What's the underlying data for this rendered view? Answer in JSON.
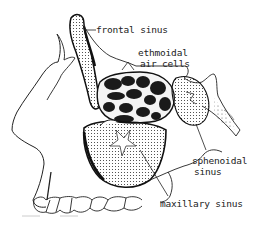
{
  "diagram": {
    "type": "anatomical-illustration",
    "labels": {
      "frontal": "frontal sinus",
      "ethmoidal_line1": "ethmoidal",
      "ethmoidal_line2": "air cells",
      "sphenoidal_line1": "sphenoidal",
      "sphenoidal_line2": "sinus",
      "maxillary": "maxillary sinus"
    },
    "colors": {
      "ink": "#222222",
      "background": "#ffffff",
      "cell_fill": "#1a1a1a"
    }
  }
}
